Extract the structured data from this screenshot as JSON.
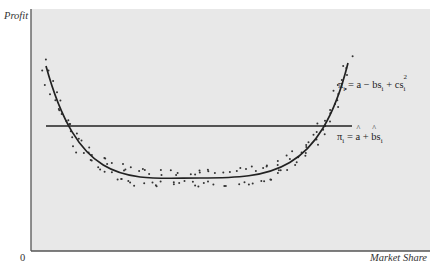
{
  "chart_data": {
    "type": "scatter",
    "title": "",
    "xlabel": "Market Share",
    "ylabel": "Profit",
    "origin_label": "0",
    "grid": false,
    "background": "#e9e9e9",
    "axis_color": "#555555",
    "series": [
      {
        "name": "observations",
        "kind": "scatter",
        "description": "Dotted observation points scattered around a U-shaped curve"
      },
      {
        "name": "quadratic_fit",
        "kind": "line",
        "equation": "πi = a − bsi + csi²",
        "shape": "U-shaped parabola"
      },
      {
        "name": "linear_fit",
        "kind": "line",
        "equation": "πi = â + b̂si",
        "shape": "horizontal flat line"
      }
    ],
    "annotations": [
      {
        "text": "πi = a − bsi + csi²",
        "attached_to": "quadratic_fit"
      },
      {
        "text": "πi = â + b̂si",
        "attached_to": "linear_fit"
      }
    ]
  },
  "labels": {
    "y_axis": "Profit",
    "x_axis": "Market Share",
    "origin": "0"
  },
  "equations": {
    "quadratic": {
      "pi": "π",
      "sub": "i",
      "eq": " = a − bs",
      "sub2": "i",
      "plus": " + cs",
      "sub3": "i",
      "sup": "2"
    },
    "linear": {
      "pi": "π",
      "sub": "i",
      "eq": " = ",
      "a": "a",
      "plus": " + ",
      "b": "b",
      "s": "s",
      "sub2": "i"
    }
  }
}
